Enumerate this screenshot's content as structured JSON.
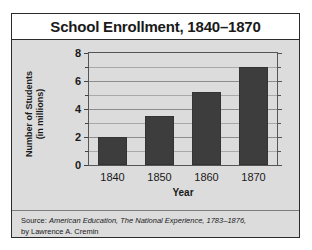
{
  "chart_data": {
    "type": "bar",
    "title": "School Enrollment, 1840–1870",
    "xlabel": "Year",
    "ylabel_line1": "Number of Students",
    "ylabel_line2": "(in millions)",
    "categories": [
      "1840",
      "1850",
      "1860",
      "1870"
    ],
    "values": [
      2.0,
      3.5,
      5.25,
      7.0
    ],
    "ylim": [
      0,
      8
    ],
    "ytick_labels": [
      "0",
      "2",
      "4",
      "6",
      "8"
    ],
    "ytick_values": [
      0,
      2,
      4,
      6,
      8
    ],
    "minor_gridline_values": [
      1,
      3,
      5,
      7
    ],
    "grid": true,
    "legend": "none",
    "bar_color": "#3d3d3d",
    "plot_background": "#dcdcdc"
  },
  "source": {
    "prefix": "Source: ",
    "work_title": "American Education, The National Experience, 1783–1876,",
    "author_line": "by Lawrence A. Cremin"
  }
}
